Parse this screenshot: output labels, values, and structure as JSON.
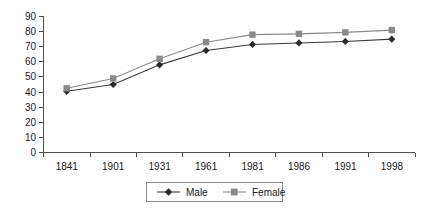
{
  "chart_data": {
    "type": "line",
    "title": "",
    "xlabel": "",
    "ylabel": "",
    "categories": [
      "1841",
      "1901",
      "1931",
      "1961",
      "1981",
      "1986",
      "1991",
      "1998"
    ],
    "series": [
      {
        "name": "Male",
        "values": [
          40.5,
          45,
          58,
          67.5,
          71.5,
          72.5,
          73.5,
          75
        ],
        "color": "#2b2b2b",
        "marker": "diamond"
      },
      {
        "name": "Female",
        "values": [
          42.5,
          49,
          62,
          73,
          78,
          78.5,
          79.5,
          81
        ],
        "color": "#8a8a8a",
        "marker": "square"
      }
    ],
    "ylim": [
      0,
      90
    ],
    "ytick_values": [
      "0",
      "10",
      "20",
      "30",
      "40",
      "50",
      "60",
      "70",
      "80",
      "90"
    ],
    "grid": false,
    "legend_position": "bottom"
  },
  "legend": {
    "entries": [
      {
        "label": "Male"
      },
      {
        "label": "Female"
      }
    ]
  }
}
